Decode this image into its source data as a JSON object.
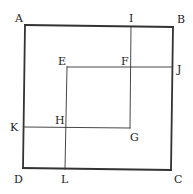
{
  "diagram": {
    "title": "",
    "colors": {
      "background": "#ffffff",
      "stroke": "#333333",
      "text": "#222222"
    },
    "points": {
      "A": [
        25,
        25
      ],
      "B": [
        173,
        27
      ],
      "C": [
        171,
        170
      ],
      "D": [
        23,
        168
      ],
      "E": [
        67,
        67
      ],
      "F": [
        131,
        67
      ],
      "G": [
        130,
        128
      ],
      "H": [
        66,
        127
      ],
      "I": [
        131,
        27
      ],
      "J": [
        172,
        67
      ],
      "K": [
        24,
        127
      ],
      "L": [
        65,
        169
      ]
    },
    "segments": [
      {
        "from": "A",
        "to": "B",
        "weight": "thick"
      },
      {
        "from": "B",
        "to": "C",
        "weight": "thick"
      },
      {
        "from": "C",
        "to": "D",
        "weight": "thick"
      },
      {
        "from": "D",
        "to": "A",
        "weight": "thick"
      },
      {
        "from": "I",
        "to": "G",
        "weight": "thin"
      },
      {
        "from": "E",
        "to": "J",
        "weight": "thin"
      },
      {
        "from": "K",
        "to": "G",
        "weight": "thin"
      },
      {
        "from": "E",
        "to": "L",
        "weight": "thin"
      }
    ],
    "labels": [
      {
        "text": "A",
        "x": 15,
        "y": 22
      },
      {
        "text": "B",
        "x": 177,
        "y": 23
      },
      {
        "text": "C",
        "x": 174,
        "y": 183
      },
      {
        "text": "D",
        "x": 14,
        "y": 183
      },
      {
        "text": "E",
        "x": 58,
        "y": 65
      },
      {
        "text": "F",
        "x": 121,
        "y": 65
      },
      {
        "text": "G",
        "x": 130,
        "y": 141
      },
      {
        "text": "H",
        "x": 55,
        "y": 124
      },
      {
        "text": "I",
        "x": 129,
        "y": 22
      },
      {
        "text": "J",
        "x": 177,
        "y": 73
      },
      {
        "text": "K",
        "x": 10,
        "y": 131
      },
      {
        "text": "L",
        "x": 61,
        "y": 183
      }
    ]
  }
}
